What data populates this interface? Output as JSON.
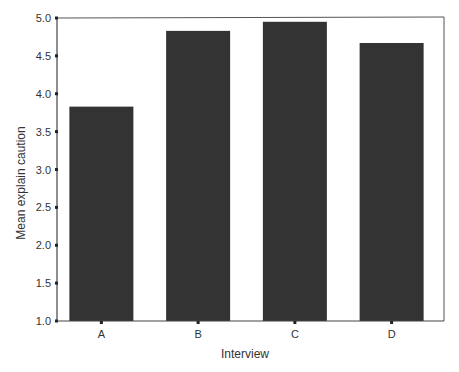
{
  "chart_data": {
    "type": "bar",
    "title": "",
    "xlabel": "Interview",
    "ylabel": "Mean explain caution",
    "categories": [
      "A",
      "B",
      "C",
      "D"
    ],
    "values": [
      3.83,
      4.83,
      4.95,
      4.67
    ],
    "ylim": [
      1.0,
      5.0
    ],
    "yticks": [
      "1.0",
      "1.5",
      "2.0",
      "2.5",
      "3.0",
      "3.5",
      "4.0",
      "4.5",
      "5.0"
    ],
    "grid": false,
    "legend": null,
    "bar_color": "#333333"
  },
  "colors": {
    "bar": "#333333",
    "axis": "#444444",
    "frame": "#555555",
    "text": "#333333",
    "background": "#ffffff"
  }
}
